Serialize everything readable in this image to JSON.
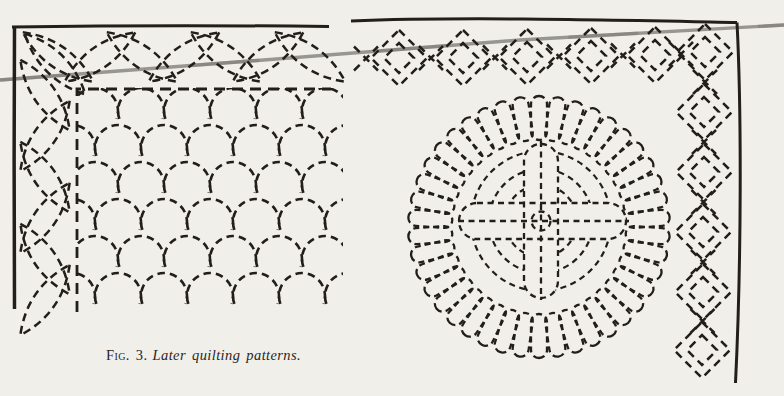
{
  "figure": {
    "caption_label": "Fig. 3.",
    "caption_title": "Later quilting patterns."
  },
  "colors": {
    "paper": "#f1efe9",
    "ink": "#221f1b",
    "scratch_line": "#8e8c88"
  }
}
